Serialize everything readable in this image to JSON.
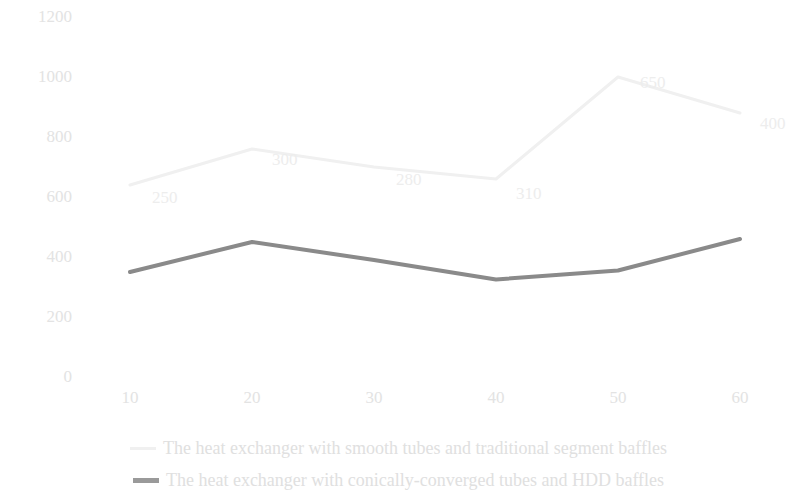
{
  "chart_data": {
    "type": "line",
    "title": "",
    "xlabel": "",
    "ylabel": "",
    "x": [
      10,
      20,
      30,
      40,
      50,
      60
    ],
    "categories": [
      "10",
      "20",
      "30",
      "40",
      "50",
      "60"
    ],
    "xtick_labels": [
      "10",
      "20",
      "30",
      "40",
      "50",
      "60"
    ],
    "ytick_labels": [
      "0",
      "200",
      "400",
      "600",
      "800",
      "1000",
      "1200"
    ],
    "ytick_values": [
      0,
      200,
      400,
      600,
      800,
      1000,
      1200
    ],
    "ylim": [
      0,
      1200
    ],
    "grid": false,
    "legend_position": "bottom",
    "series": [
      {
        "name": "The heat exchanger with smooth tubes and traditional segment baffles",
        "color": "#f0f0f0",
        "values": [
          640,
          760,
          700,
          660,
          1000,
          880
        ],
        "point_labels": [
          "250",
          "300",
          "280",
          "310",
          "650",
          "400"
        ],
        "label_values": [
          250,
          300,
          280,
          310,
          650,
          400
        ]
      },
      {
        "name": "The heat exchanger with conically-converged tubes and HDD baffles",
        "color": "#8a8a8a",
        "values": [
          350,
          450,
          390,
          325,
          355,
          460
        ],
        "point_labels": [
          "",
          "",
          "",
          "",
          "",
          ""
        ]
      }
    ]
  },
  "legend": {
    "items": [
      {
        "label": "The heat exchanger with smooth tubes and traditional segment baffles",
        "swatch": "light-line-swatch"
      },
      {
        "label": "The heat exchanger with conically-converged tubes and HDD baffles",
        "swatch": "dark-line-swatch"
      }
    ]
  },
  "colors": {
    "series_light": "#f0f0f0",
    "series_dark": "#8a8a8a",
    "axis_text": "#e3e3e3",
    "data_label_text": "#ededed",
    "legend_text": "#e0e0e0",
    "background": "#ffffff"
  }
}
